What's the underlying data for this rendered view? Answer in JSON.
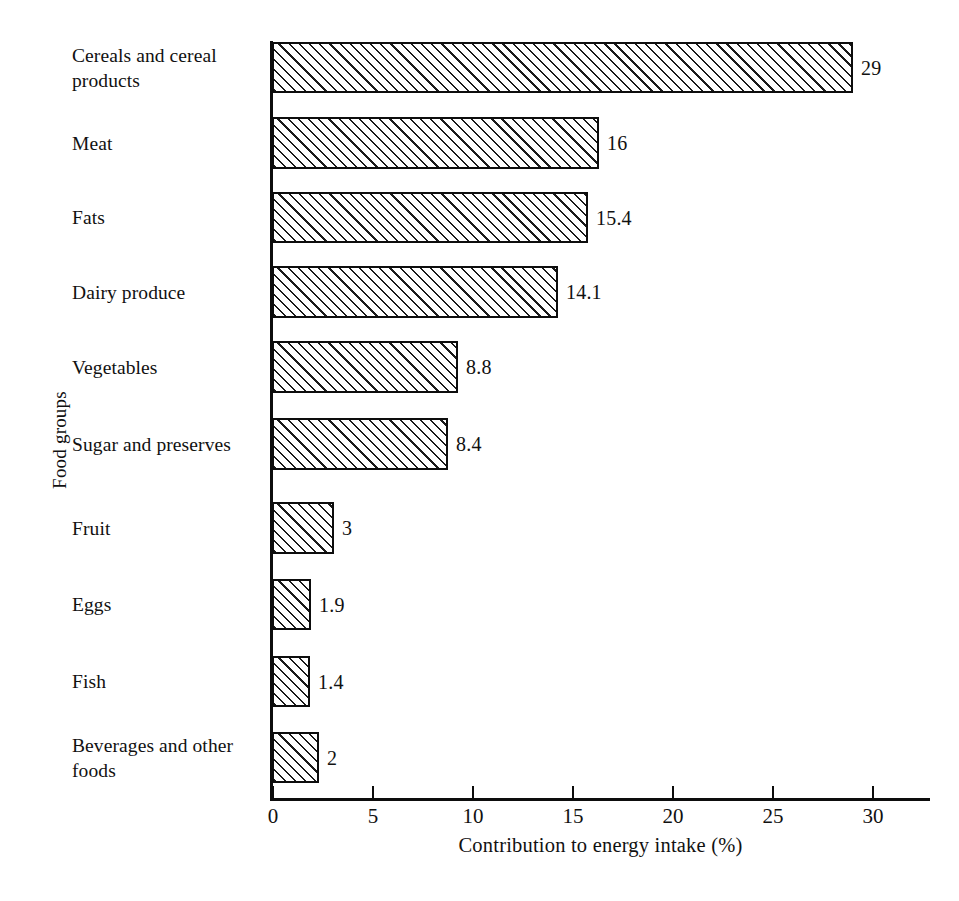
{
  "chart_data": {
    "type": "bar",
    "orientation": "horizontal",
    "title": "",
    "xlabel": "Contribution to energy intake (%)",
    "ylabel": "Food groups",
    "xlim": [
      0,
      33
    ],
    "xticks": [
      0,
      5,
      10,
      15,
      20,
      25,
      30
    ],
    "xtick_labels": [
      "0",
      "5",
      "10",
      "15",
      "20",
      "25",
      "30"
    ],
    "grid": false,
    "legend": null,
    "categories": [
      "Cereals and cereal products",
      "Meat",
      "Fats",
      "Dairy produce",
      "Vegetables",
      "Sugar and preserves",
      "Fruit",
      "Eggs",
      "Fish",
      "Beverages and other foods"
    ],
    "values": [
      29,
      16,
      15.4,
      14.1,
      8.8,
      8.4,
      3,
      1.9,
      1.4,
      2
    ],
    "value_labels": [
      "29",
      "16",
      "15.4",
      "14.1",
      "8.8",
      "8.4",
      "3",
      "1.9",
      "1.4",
      "2"
    ],
    "bar_style": {
      "fill": "diagonal-hatch",
      "hatch_direction": "forward-slash",
      "edge_color": "#0d0d0d",
      "face_color": "#ffffff"
    }
  },
  "axes": {
    "x_title": "Contribution to energy intake (%)",
    "y_title": "Food groups",
    "tick_labels": [
      "0",
      "5",
      "10",
      "15",
      "20",
      "25",
      "30"
    ]
  },
  "bars": [
    {
      "label": "Cereals and cereal products",
      "value_label": "29",
      "bar_px_width": 581,
      "top": 42,
      "height": 51
    },
    {
      "label": "Meat",
      "value_label": "16",
      "bar_px_width": 327,
      "top": 117,
      "height": 52
    },
    {
      "label": "Fats",
      "value_label": "15.4",
      "bar_px_width": 316,
      "top": 192,
      "height": 51
    },
    {
      "label": "Dairy produce",
      "value_label": "14.1",
      "bar_px_width": 286,
      "top": 266,
      "height": 52
    },
    {
      "label": "Vegetables",
      "value_label": "8.8",
      "bar_px_width": 186,
      "top": 341,
      "height": 52
    },
    {
      "label": "Sugar and preserves",
      "value_label": "8.4",
      "bar_px_width": 176,
      "top": 418,
      "height": 52
    },
    {
      "label": "Fruit",
      "value_label": "3",
      "bar_px_width": 62,
      "top": 502,
      "height": 52
    },
    {
      "label": "Eggs",
      "value_label": "1.9",
      "bar_px_width": 39,
      "top": 579,
      "height": 51
    },
    {
      "label": "Fish",
      "value_label": "1.4",
      "bar_px_width": 38,
      "top": 656,
      "height": 51
    },
    {
      "label": "Beverages and other foods",
      "value_label": "2",
      "bar_px_width": 47,
      "top": 732,
      "height": 51
    }
  ],
  "ticks": [
    {
      "label": "0",
      "x": 272
    },
    {
      "label": "5",
      "x": 372
    },
    {
      "label": "10",
      "x": 472
    },
    {
      "label": "15",
      "x": 572
    },
    {
      "label": "20",
      "x": 672
    },
    {
      "label": "25",
      "x": 772
    },
    {
      "label": "30",
      "x": 872
    }
  ]
}
